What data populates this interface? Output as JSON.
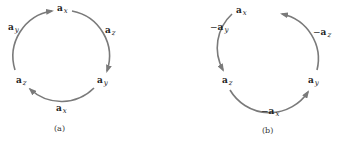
{
  "colors": {
    "arc": "#7a7a7a",
    "text": "#222222",
    "background": "#ffffff"
  },
  "panels": [
    {
      "caption": "(a)",
      "direction": "clockwise",
      "nodes": [
        {
          "id": "x",
          "vec": "a",
          "sub": "x",
          "sign": ""
        },
        {
          "id": "y",
          "vec": "a",
          "sub": "y",
          "sign": ""
        },
        {
          "id": "z",
          "vec": "a",
          "sub": "z",
          "sign": ""
        }
      ],
      "arcs": [
        {
          "from": "x",
          "to": "y",
          "label_sign": "",
          "label_vec": "a",
          "label_sub": "z"
        },
        {
          "from": "y",
          "to": "z",
          "label_sign": "",
          "label_vec": "a",
          "label_sub": "x"
        },
        {
          "from": "z",
          "to": "x",
          "label_sign": "",
          "label_vec": "a",
          "label_sub": "y"
        }
      ]
    },
    {
      "caption": "(b)",
      "direction": "counterclockwise",
      "nodes": [
        {
          "id": "x",
          "vec": "a",
          "sub": "x",
          "sign": ""
        },
        {
          "id": "y",
          "vec": "a",
          "sub": "y",
          "sign": ""
        },
        {
          "id": "z",
          "vec": "a",
          "sub": "z",
          "sign": ""
        }
      ],
      "arcs": [
        {
          "from": "x",
          "to": "z",
          "label_sign": "−",
          "label_vec": "a",
          "label_sub": "y"
        },
        {
          "from": "z",
          "to": "y",
          "label_sign": "−",
          "label_vec": "a",
          "label_sub": "x"
        },
        {
          "from": "y",
          "to": "x",
          "label_sign": "−",
          "label_vec": "a",
          "label_sub": "z"
        }
      ]
    }
  ]
}
